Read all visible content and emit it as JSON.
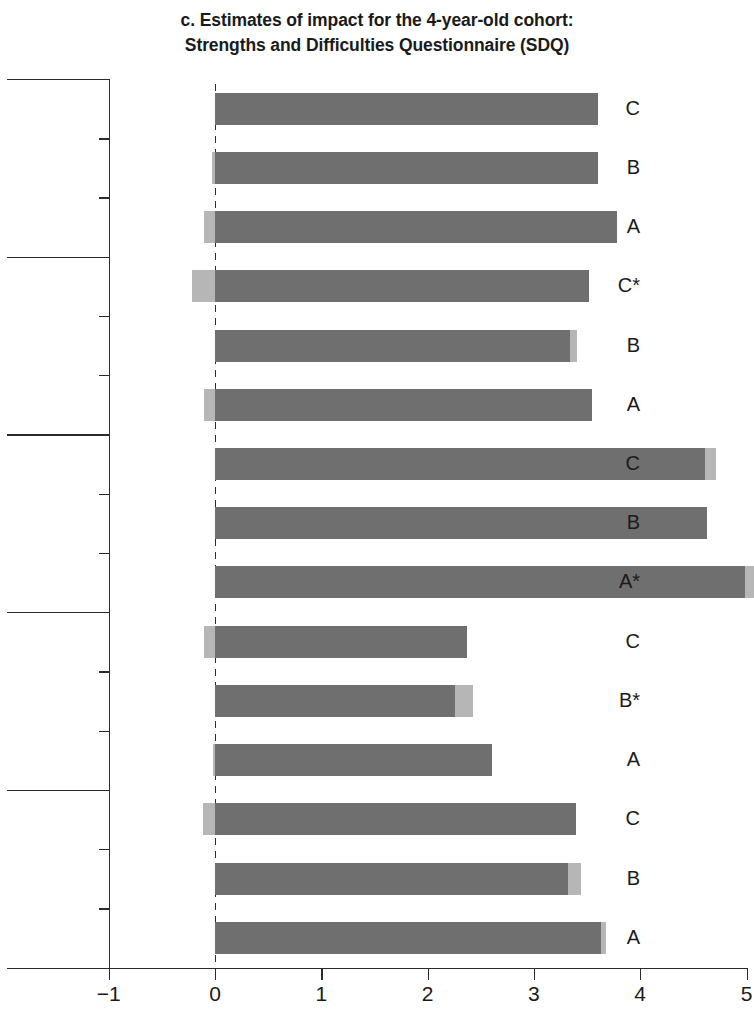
{
  "title": {
    "line1": "c. Estimates of impact for the 4-year-old cohort:",
    "line2": "Strengths and Difficulties Questionnaire (SDQ)"
  },
  "axis": {
    "x_ticks": [
      "−1",
      "0",
      "1",
      "2",
      "3",
      "4",
      "5"
    ],
    "x_min": -1,
    "x_max": 5
  },
  "colors": {
    "bar_dark": "#6f6f6f",
    "bar_light": "#b6b6b6",
    "axis": "#2b2b2b",
    "background": "#ffffff"
  },
  "groups": [
    {
      "name_line1": "Emotional",
      "name_line2": "symptoms"
    },
    {
      "name_line1": "Conduct",
      "name_line2": "problems"
    },
    {
      "name_line1": "Hyperactivity/",
      "name_line2": "inattention"
    },
    {
      "name_line1": "Peer problems",
      "name_line2": ""
    },
    {
      "name_line1": "Prosocial behavior",
      "name_line2": "(reversed)"
    }
  ],
  "chart_data": {
    "type": "bar",
    "orientation": "horizontal",
    "title": "c. Estimates of impact for the 4-year-old cohort: Strengths and Difficulties Questionnaire (SDQ)",
    "xlabel": "",
    "ylabel": "",
    "xlim": [
      -1,
      5
    ],
    "xticks": [
      -1,
      0,
      1,
      2,
      3,
      4,
      5
    ],
    "grid": false,
    "legend": "none",
    "note": "Each bar spans the lower to upper interval; the darker segment is the main estimate range and the lighter segment marks the remainder of the interval. Asterisk (*) marks statistically significant estimates.",
    "groups": [
      {
        "group": "Emotional symptoms",
        "bars": [
          {
            "label": "C",
            "significant": false,
            "low": 0.0,
            "high": 3.6,
            "dark_low": 0.0,
            "dark_high": 3.6
          },
          {
            "label": "B",
            "significant": false,
            "low": -0.03,
            "high": 3.6,
            "dark_low": 0.0,
            "dark_high": 3.6
          },
          {
            "label": "A",
            "significant": false,
            "low": -0.1,
            "high": 3.78,
            "dark_low": 0.0,
            "dark_high": 3.78
          }
        ]
      },
      {
        "group": "Conduct problems",
        "bars": [
          {
            "label": "C*",
            "significant": true,
            "low": -0.22,
            "high": 3.52,
            "dark_low": 0.0,
            "dark_high": 3.52
          },
          {
            "label": "B",
            "significant": false,
            "low": 0.0,
            "high": 3.41,
            "dark_low": 0.0,
            "dark_high": 3.34
          },
          {
            "label": "A",
            "significant": false,
            "low": -0.1,
            "high": 3.55,
            "dark_low": 0.0,
            "dark_high": 3.55
          }
        ]
      },
      {
        "group": "Hyperactivity/inattention",
        "bars": [
          {
            "label": "C",
            "significant": false,
            "low": 0.0,
            "high": 4.71,
            "dark_low": 0.0,
            "dark_high": 4.61
          },
          {
            "label": "B",
            "significant": false,
            "low": 0.0,
            "high": 4.63,
            "dark_low": 0.0,
            "dark_high": 4.63
          },
          {
            "label": "A*",
            "significant": true,
            "low": 0.0,
            "high": 5.07,
            "dark_low": 0.0,
            "dark_high": 4.99
          }
        ]
      },
      {
        "group": "Peer problems",
        "bars": [
          {
            "label": "C",
            "significant": false,
            "low": -0.1,
            "high": 2.37,
            "dark_low": 0.0,
            "dark_high": 2.37
          },
          {
            "label": "B*",
            "significant": true,
            "low": 0.0,
            "high": 2.43,
            "dark_low": 0.0,
            "dark_high": 2.26
          },
          {
            "label": "A",
            "significant": false,
            "low": -0.02,
            "high": 2.61,
            "dark_low": 0.0,
            "dark_high": 2.61
          }
        ]
      },
      {
        "group": "Prosocial behavior (reversed)",
        "bars": [
          {
            "label": "C",
            "significant": false,
            "low": -0.11,
            "high": 3.4,
            "dark_low": 0.0,
            "dark_high": 3.4
          },
          {
            "label": "B",
            "significant": false,
            "low": 0.0,
            "high": 3.44,
            "dark_low": 0.0,
            "dark_high": 3.32
          },
          {
            "label": "A",
            "significant": false,
            "low": 0.0,
            "high": 3.68,
            "dark_low": 0.0,
            "dark_high": 3.63
          }
        ]
      }
    ]
  }
}
